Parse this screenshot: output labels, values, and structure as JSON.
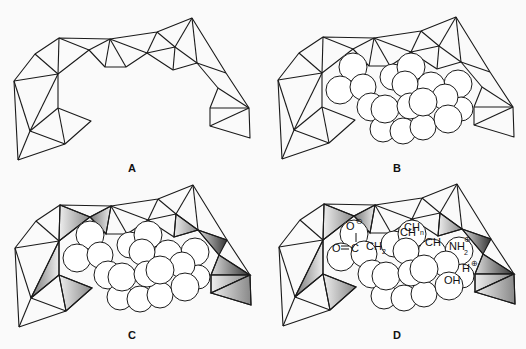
{
  "figure": {
    "panels": [
      {
        "id": "A",
        "label": "A",
        "content": "framework only"
      },
      {
        "id": "B",
        "label": "B",
        "content": "framework with substrate spheres"
      },
      {
        "id": "C",
        "label": "C",
        "content": "framework with shaded contact facets and spheres"
      },
      {
        "id": "D",
        "label": "D",
        "content": "shaded framework with labeled functional groups"
      }
    ],
    "groups_D": {
      "o_minus": "O",
      "o_minus_charge": "⊖",
      "o_double": "O",
      "c": "C",
      "ch2_a": "CH",
      "ch2_a_sub": "2",
      "ch_n": "CH",
      "ch_n_sub": "n",
      "ch_partial": "CH",
      "ch2_b": "CH",
      "ch2_b_sub": "2",
      "nh2": "NH",
      "nh2_sub": "2",
      "nh2_charge": "⊕",
      "oh": "OH",
      "h": "H",
      "h_charge": "⊕"
    },
    "colors": {
      "line": "#1a1a1a",
      "background": "#fafafa",
      "shade_dark": "#3a3a3a",
      "shade_light": "#e8e8e8"
    }
  }
}
